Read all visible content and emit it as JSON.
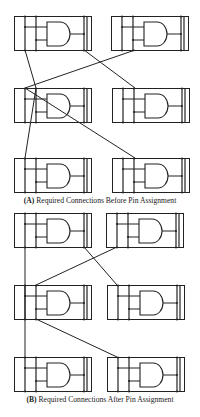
{
  "figure": {
    "panels": [
      {
        "id": "A",
        "caption_tag": "(A)",
        "caption_text": "Required Connections Before Pin Assignment",
        "caption_y": 196,
        "modules": [
          {
            "name": "module-a-r1-left",
            "x": 14,
            "y": 16
          },
          {
            "name": "module-a-r1-right",
            "x": 111,
            "y": 16
          },
          {
            "name": "module-a-r2-left",
            "x": 14,
            "y": 88
          },
          {
            "name": "module-a-r2-right",
            "x": 112,
            "y": 88
          },
          {
            "name": "module-a-r3-left",
            "x": 14,
            "y": 158
          },
          {
            "name": "module-a-r3-right",
            "x": 112,
            "y": 158
          }
        ],
        "wires": [
          {
            "x1": 25,
            "y1": 50,
            "x2": 36,
            "y2": 88
          },
          {
            "x1": 84,
            "y1": 50,
            "x2": 135,
            "y2": 88
          },
          {
            "x1": 135,
            "y1": 50,
            "x2": 25,
            "y2": 88
          },
          {
            "x1": 36,
            "y1": 88,
            "x2": 25,
            "y2": 158
          },
          {
            "x1": 25,
            "y1": 88,
            "x2": 135,
            "y2": 158
          }
        ]
      },
      {
        "id": "B",
        "caption_tag": "(B)",
        "caption_text": "Required Connections After Pin Assignment",
        "caption_y": 395,
        "modules": [
          {
            "name": "module-b-r1-left",
            "x": 14,
            "y": 213
          },
          {
            "name": "module-b-r1-right",
            "x": 106,
            "y": 213
          },
          {
            "name": "module-b-r2-left",
            "x": 14,
            "y": 285
          },
          {
            "name": "module-b-r2-right",
            "x": 107,
            "y": 285
          },
          {
            "name": "module-b-r3-left",
            "x": 14,
            "y": 357
          },
          {
            "name": "module-b-r3-right",
            "x": 107,
            "y": 357
          }
        ],
        "wires": [
          {
            "x1": 25,
            "y1": 247,
            "x2": 25,
            "y2": 357
          },
          {
            "x1": 117,
            "y1": 247,
            "x2": 36,
            "y2": 285
          },
          {
            "x1": 84,
            "y1": 247,
            "x2": 117,
            "y2": 285
          },
          {
            "x1": 36,
            "y1": 319,
            "x2": 117,
            "y2": 357
          }
        ]
      }
    ],
    "module_shape": {
      "width": 77,
      "height": 34,
      "bus_x": [
        11,
        22,
        70,
        73
      ],
      "input1_y": 11,
      "input2_y": 24,
      "gate_left": 33,
      "gate_straight_end": 46,
      "gate_top": 6,
      "gate_bottom": 30,
      "gate_right": 56,
      "output_y": 18
    },
    "colors": {
      "line": "#222222",
      "background": "#ffffff"
    }
  }
}
